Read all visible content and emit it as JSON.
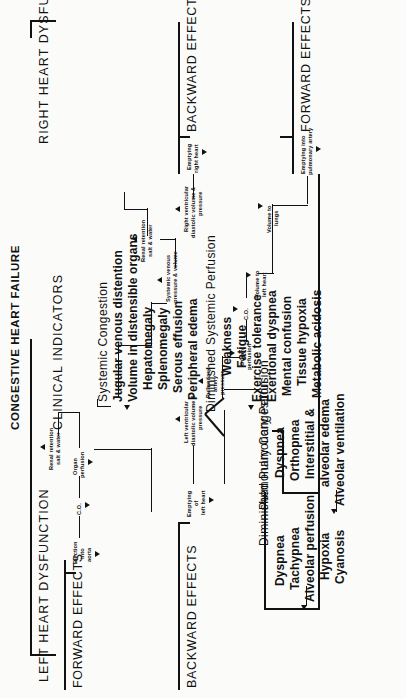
{
  "diagram": {
    "title": "CONGESTIVE HEART FAILURE",
    "branches": {
      "left": "LEFT HEART DYSFUNCTION",
      "right": "RIGHT HEART DYSFUNCTION",
      "center": "CLINICAL INDICATORS"
    },
    "effect_captions": {
      "left_forward": "FORWARD EFFECTS",
      "left_backward": "BACKWARD EFFECTS",
      "right_backward": "BACKWARD EFFECTS",
      "right_forward": "FORWARD EFFECTS"
    },
    "signs": {
      "decrease": "↓",
      "increase": "↑"
    },
    "left_forward_chain": [
      {
        "label": "Ejection\ninto\naorta",
        "sign": "↓"
      },
      {
        "label": "C.O.",
        "sign": "↓"
      },
      {
        "label": "Organ\nperfusion",
        "sign": "↓"
      },
      {
        "label": "Renal retention\nsalt & water",
        "sign": "↑"
      }
    ],
    "left_backward_chain": [
      {
        "label": "Emptying\nof\nleft heart",
        "sign": "↓"
      },
      {
        "label": "Left ventricular\ndiastolic volume &\npressure",
        "sign": "↑"
      },
      {
        "label": "Pulmonary\nartery\npressure",
        "sign": "↑"
      }
    ],
    "right_backward_chain": [
      {
        "label": "Emptying\nright heart",
        "sign": "↓"
      },
      {
        "label": "Right ventricular\ndiastolic volume &\npressure",
        "sign": "↑"
      },
      {
        "label": "Systemic venous\npressure & volume",
        "sign": "↑"
      },
      {
        "label": "Renal retention\nsalt & water",
        "sign": "↑"
      }
    ],
    "right_forward_chain": [
      {
        "label": "Emptying into\npulmonary artery",
        "sign": "↓"
      },
      {
        "label": "Volume to\nlungs",
        "sign": "↓"
      },
      {
        "label": "Volume to\nleft heart",
        "sign": "↓"
      },
      {
        "label": "C.O.",
        "sign": "↓"
      },
      {
        "label": "Organ\nperfusion",
        "sign": "↓"
      }
    ],
    "indicator_groups": [
      {
        "name": "Systemic Congestion",
        "items": [
          "Jugular venous distention",
          "Volume in distensible organs",
          "Hepatomegaly",
          "Splenomegaly",
          "Serous effusion",
          "Peripheral edema"
        ]
      },
      {
        "name": "Diminished Systemic Perfusion",
        "items": [
          "Weakness",
          "Fatigue",
          "Exercise tolerance",
          "Exertional dyspnea",
          "Mental confusion",
          "Tissue hypoxia",
          "Metabolic acidosis"
        ]
      },
      {
        "name": "Pulmonary Congestion",
        "items": [
          "Dyspnea",
          "Orthopnea",
          "Interstitial &",
          "alveolar edema",
          "Alveolar ventilation"
        ]
      },
      {
        "name": "Diminished Pulmonary Perfusion",
        "items": [
          "Dyspnea",
          "Tachypnea",
          "Alveolar perfusion",
          "Hypoxia",
          "Cyanosis"
        ]
      }
    ],
    "colors": {
      "ink": "#111111",
      "paper": "#fbfbf9"
    }
  }
}
